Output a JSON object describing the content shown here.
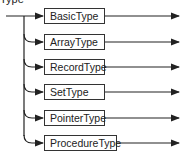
{
  "diagram": {
    "title": "Type",
    "nodes": [
      {
        "label": "BasicType",
        "y": 8,
        "width": 61
      },
      {
        "label": "ArrayType",
        "y": 34,
        "width": 61
      },
      {
        "label": "RecordType",
        "y": 59,
        "width": 61
      },
      {
        "label": "SetType",
        "y": 84,
        "width": 61
      },
      {
        "label": "PointerType",
        "y": 110,
        "width": 61
      },
      {
        "label": "ProcedureType",
        "y": 135,
        "width": 73
      }
    ],
    "colors": {
      "line": "#222222",
      "box_border": "#333333",
      "text": "#222222"
    }
  }
}
